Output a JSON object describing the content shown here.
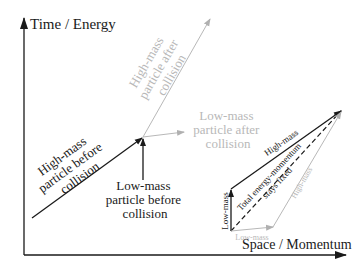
{
  "diagram": {
    "axes": {
      "y_label": "Time / Energy",
      "x_label": "Space / Momentum"
    },
    "main": {
      "high_mass_before": {
        "label_lines": [
          "High-mass",
          "particle before",
          "collision"
        ],
        "color": "#1a1a1a"
      },
      "low_mass_before": {
        "label_lines": [
          "Low-mass",
          "particle before",
          "collision"
        ],
        "color": "#1a1a1a"
      },
      "high_mass_after": {
        "label_lines": [
          "High-mass",
          "particle after",
          "collision"
        ],
        "color": "#b0b0b0"
      },
      "low_mass_after": {
        "label_lines": [
          "Low-mass",
          "particle after",
          "collision"
        ],
        "color": "#b0b0b0"
      }
    },
    "inset": {
      "low_mass_before_label": "Low-mass",
      "high_mass_before_label": "High-mass",
      "total_label_lines": [
        "Total energy-momentum",
        "stays fixed"
      ],
      "low_mass_after_label": "Low-mass",
      "high_mass_after_label": "High-mass"
    }
  }
}
